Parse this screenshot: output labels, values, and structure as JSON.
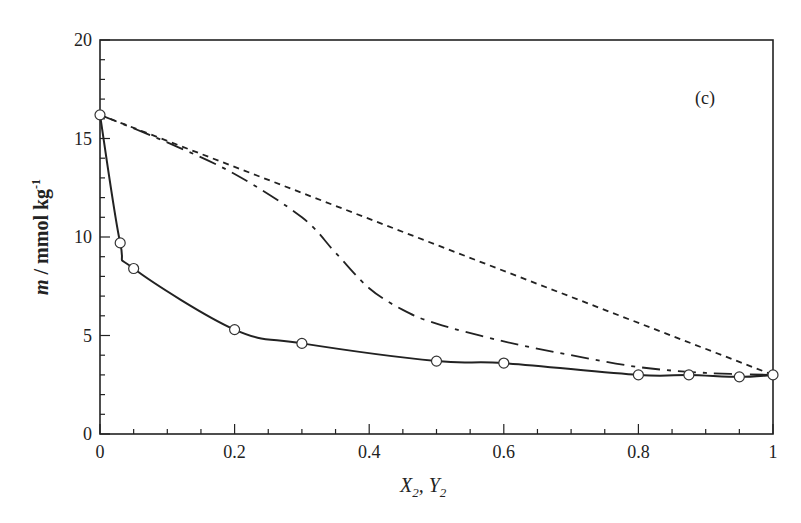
{
  "chart_data": {
    "type": "line",
    "title": "",
    "panel_label": "(c)",
    "xlabel": "X2, Y2",
    "ylabel": "m / mmol kg-1",
    "xlim": [
      0,
      1
    ],
    "ylim": [
      0,
      20
    ],
    "x_ticks": [
      "0",
      "0.2",
      "0.4",
      "0.6",
      "0.8",
      "1"
    ],
    "y_ticks": [
      "0",
      "5",
      "10",
      "15",
      "20"
    ],
    "grid": false,
    "series": [
      {
        "name": "experimental points (solid curve)",
        "style": "solid-with-open-circles",
        "x": [
          0,
          0.03,
          0.05,
          0.2,
          0.3,
          0.5,
          0.6,
          0.8,
          0.875,
          0.95,
          1.0
        ],
        "y": [
          16.2,
          9.7,
          8.4,
          5.3,
          4.6,
          3.7,
          3.6,
          3.0,
          3.0,
          2.9,
          3.0
        ]
      },
      {
        "name": "dash-dot curve",
        "style": "dash-dot",
        "x": [
          0,
          0.1,
          0.2,
          0.3,
          0.35,
          0.4,
          0.45,
          0.5,
          0.6,
          0.7,
          0.8,
          0.9,
          1.0
        ],
        "y": [
          16.2,
          14.8,
          13.2,
          11.0,
          9.2,
          7.4,
          6.3,
          5.6,
          4.7,
          4.0,
          3.4,
          3.1,
          3.0
        ]
      },
      {
        "name": "short-dash line",
        "style": "short-dash",
        "x": [
          0,
          1
        ],
        "y": [
          16.2,
          3.0
        ]
      }
    ]
  }
}
